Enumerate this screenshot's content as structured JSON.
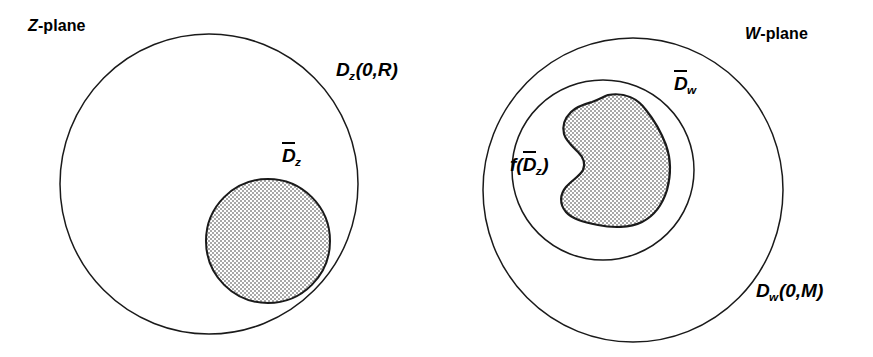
{
  "figure": {
    "title_left": "Z-plane",
    "title_right": "W-plane",
    "background_color": "#ffffff",
    "stroke_color": "#1a1a1a",
    "shade_color": "#cccccc"
  },
  "z_plane": {
    "plane_var": "Z",
    "plane_suffix": "-plane",
    "outer_disk": {
      "symbol": "D",
      "subscript": "z",
      "args": "(0,R)",
      "full_label": "Dz(0,R)",
      "center": [
        209,
        184
      ],
      "radius": 149,
      "filled": false
    },
    "inner_disk": {
      "symbol": "D",
      "subscript": "z",
      "overline": true,
      "full_label": "D̄z",
      "center": [
        268,
        241
      ],
      "radius": 62,
      "filled": true
    }
  },
  "w_plane": {
    "plane_var": "W",
    "plane_suffix": "-plane",
    "outer_disk": {
      "symbol": "D",
      "subscript": "w",
      "args": "(0,M)",
      "full_label": "Dw(0,M)",
      "center": [
        633,
        190
      ],
      "radius": 150,
      "filled": false
    },
    "middle_disk": {
      "symbol": "D",
      "subscript": "w",
      "overline": true,
      "full_label": "D̄w",
      "center": [
        603,
        170
      ],
      "radius": 90,
      "filled": false
    },
    "image_region": {
      "prefix": "f(",
      "symbol": "D",
      "subscript": "z",
      "suffix": ")",
      "overline": true,
      "full_label": "f(D̄z)",
      "filled": true,
      "shape": "kidney-blob"
    }
  }
}
